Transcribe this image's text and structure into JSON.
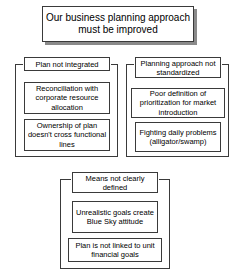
{
  "diagram": {
    "title": {
      "text": "Our business planning approach must be improved"
    },
    "clusters": [
      {
        "id": "left",
        "header": "Plan not integrated",
        "nodes": [
          "Reconciliation with corporate resource allocation",
          "Ownership of plan doesn't cross functional lines"
        ]
      },
      {
        "id": "right",
        "header": "Planning approach not standardized",
        "nodes": [
          "Poor definition of prioritization for market introduction",
          "Fighting daily problems (alligator/swamp)"
        ]
      },
      {
        "id": "bottom",
        "header": "Means not clearly defined",
        "nodes": [
          "Unrealistic goals create Blue Sky attitude",
          "Plan is not linked to unit financial goals"
        ]
      }
    ]
  },
  "colors": {
    "border": "#3a3a3a",
    "shadow": "#8a8a8a",
    "background": "#ffffff",
    "text": "#000000"
  }
}
